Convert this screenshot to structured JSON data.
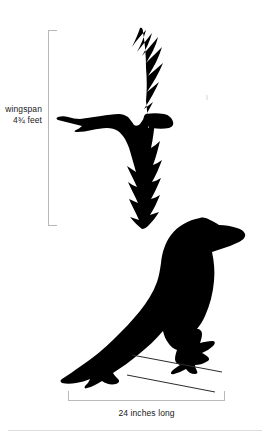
{
  "figure": {
    "background_color": "#ffffff",
    "silhouette_color": "#000000",
    "rule_color": "#b9b9b9",
    "text_color": "#202020"
  },
  "measurements": {
    "wingspan": {
      "label_line1": "wingspan",
      "label_line2": "4¾ feet",
      "value": 4.75,
      "unit": "feet",
      "orientation": "vertical"
    },
    "length": {
      "label": "24 inches long",
      "value": 24,
      "unit": "inches",
      "orientation": "horizontal"
    }
  },
  "subjects": [
    {
      "name": "flying-raven",
      "description": "raven in flight seen from above with wings fully spread"
    },
    {
      "name": "perched-raven",
      "description": "raven perched in profile facing right"
    }
  ]
}
